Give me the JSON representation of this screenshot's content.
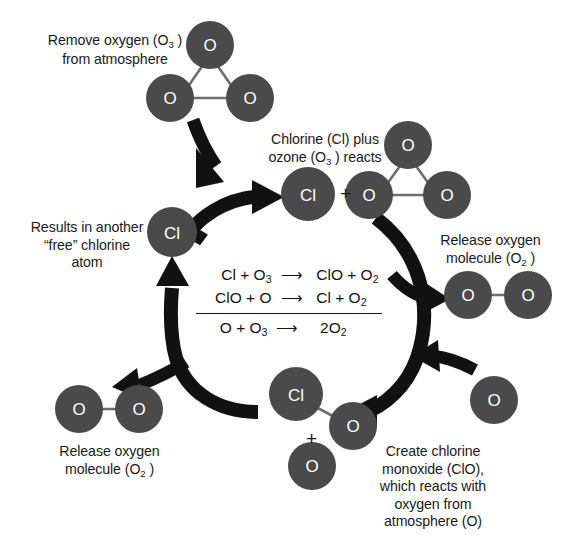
{
  "diagram": {
    "colors": {
      "atom_fill": "#4a4a4a",
      "atom_text": "#ffffff",
      "bond": "#6e6e6e",
      "arrow": "#111111",
      "text": "#1a1a1a",
      "background": "#ffffff"
    },
    "labels": {
      "remove_oxygen": [
        "Remove oxygen (O3)",
        "from atmosphere"
      ],
      "chlorine_plus_ozone": [
        "Chlorine (Cl) plus",
        "ozone (O3 ) reacts"
      ],
      "release_oxygen_right": [
        "Release oxygen",
        "molecule (O2 )"
      ],
      "results_free_chlorine": [
        "Results in another",
        "“free” chlorine",
        "atom"
      ],
      "release_oxygen_left": [
        "Release oxygen",
        "molecule (O2 )"
      ],
      "create_chlorine_monoxide": [
        "Create chlorine",
        "monoxide (ClO),",
        "which reacts with",
        "oxygen from",
        "atmosphere (O)"
      ]
    },
    "atoms": {
      "ozone_top": [
        "O",
        "O",
        "O"
      ],
      "chlorine_reacting": "Cl",
      "ozone_right": [
        "O",
        "O"
      ],
      "chlorine_free": "Cl",
      "oxygen_molecule_right": [
        "O",
        "O"
      ],
      "oxygen_molecule_left": [
        "O",
        "O"
      ],
      "chlorine_monoxide": [
        "Cl",
        "O"
      ],
      "free_oxygen_bottom": "O",
      "free_oxygen_right": "O"
    },
    "plus_signs": {
      "between_cl_and_ozone": "+",
      "below_clo": "+"
    },
    "equations": {
      "row1": {
        "left": "Cl + O3",
        "arrow": "⟶",
        "right": "ClO + O2"
      },
      "row2": {
        "left": "ClO + O",
        "arrow": "⟶",
        "right": "Cl + O2"
      },
      "row3": {
        "left": "O + O3",
        "arrow": "⟶",
        "right": "2O2"
      }
    }
  }
}
